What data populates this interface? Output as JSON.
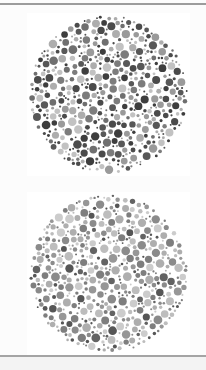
{
  "page": {
    "width": 206,
    "height": 370,
    "background": "#fcfcfc",
    "top_rule": {
      "y": 3,
      "thickness": 2,
      "color": "#9c9c9c"
    },
    "bottom_rule": {
      "y": 355,
      "thickness": 2,
      "color": "#a4a4a4"
    },
    "footer_band": {
      "height": 13,
      "color": "#f3f3f3"
    }
  },
  "plates": [
    {
      "name": "ishihara-plate-top",
      "left": 27,
      "top": 13,
      "size": 163,
      "cx": 81.5,
      "cy": 81.5,
      "radius": 80,
      "seed": 1337,
      "gap": 0.45,
      "background": "#ffffff",
      "palette": [
        {
          "color": "#3e3e3e",
          "weight": 13
        },
        {
          "color": "#4b4b4b",
          "weight": 13
        },
        {
          "color": "#585858",
          "weight": 12
        },
        {
          "color": "#6f6f6f",
          "weight": 11
        },
        {
          "color": "#7c7c7c",
          "weight": 11
        },
        {
          "color": "#9a9a9a",
          "weight": 14
        },
        {
          "color": "#adadad",
          "weight": 14
        },
        {
          "color": "#c2c2c2",
          "weight": 12
        }
      ],
      "tiers": [
        {
          "rmin": 3.2,
          "rmax": 4.4,
          "attempts": 280
        },
        {
          "rmin": 2.2,
          "rmax": 3.1,
          "attempts": 550
        },
        {
          "rmin": 1.4,
          "rmax": 2.1,
          "attempts": 950
        },
        {
          "rmin": 0.9,
          "rmax": 1.3,
          "attempts": 1600
        }
      ]
    },
    {
      "name": "ishihara-plate-bottom",
      "left": 27,
      "top": 192,
      "size": 163,
      "cx": 81.5,
      "cy": 81.5,
      "radius": 80,
      "seed": 9021,
      "gap": 0.45,
      "background": "#ffffff",
      "palette": [
        {
          "color": "#565656",
          "weight": 9
        },
        {
          "color": "#636363",
          "weight": 9
        },
        {
          "color": "#7e7e7e",
          "weight": 14
        },
        {
          "color": "#8b8b8b",
          "weight": 14
        },
        {
          "color": "#979797",
          "weight": 14
        },
        {
          "color": "#aeaeae",
          "weight": 14
        },
        {
          "color": "#bdbdbd",
          "weight": 14
        },
        {
          "color": "#cccccc",
          "weight": 12
        }
      ],
      "tiers": [
        {
          "rmin": 3.2,
          "rmax": 4.4,
          "attempts": 280
        },
        {
          "rmin": 2.2,
          "rmax": 3.1,
          "attempts": 550
        },
        {
          "rmin": 1.4,
          "rmax": 2.1,
          "attempts": 950
        },
        {
          "rmin": 0.9,
          "rmax": 1.3,
          "attempts": 1600
        }
      ]
    }
  ]
}
